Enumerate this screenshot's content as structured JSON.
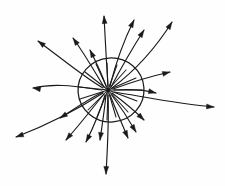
{
  "figure": {
    "background_color": "#fefefe",
    "ink_color": "#1a1a1a",
    "width": 225,
    "height": 186
  },
  "chart_data": {
    "type": "diagram",
    "style": "hand-drawn line art",
    "source_point": {
      "x": 108,
      "y": 90,
      "label": "point source"
    },
    "enclosing_surface": {
      "shape": "ellipse",
      "cx": 111,
      "cy": 90,
      "rx": 33,
      "ry": 32,
      "rotation_deg": -4,
      "stroke": "#1a1a1a"
    },
    "field_line_count": 20,
    "direction": "outward",
    "field_lines": [
      {
        "id": 1,
        "angle_deg": 268,
        "path": "M 108 86 C 106 56 105 34 104 16",
        "tip": [
          104,
          16
        ],
        "tip_angle_deg": 265
      },
      {
        "id": 2,
        "angle_deg": 288,
        "path": "M 110 86 C 116 62 124 40 134 20",
        "tip": [
          134,
          20
        ],
        "tip_angle_deg": 296
      },
      {
        "id": 3,
        "angle_deg": 303,
        "path": "M 111 87 C 120 70 130 52 144 30",
        "tip": [
          144,
          30
        ],
        "tip_angle_deg": 302
      },
      {
        "id": 4,
        "angle_deg": 318,
        "path": "M 112 88 C 128 76 152 54 172 22",
        "tip": [
          172,
          22
        ],
        "tip_angle_deg": 302
      },
      {
        "id": 5,
        "angle_deg": 330,
        "path": "M 113 89 C 132 82 152 76 170 72",
        "tip": [
          170,
          72
        ],
        "tip_angle_deg": 345
      },
      {
        "id": 6,
        "angle_deg": 352,
        "path": "M 114 90 C 132 89 146 90 156 93",
        "tip": [
          156,
          93
        ],
        "tip_angle_deg": 14
      },
      {
        "id": 7,
        "angle_deg": 3,
        "path": "M 114 92 C 140 96 178 104 214 107",
        "tip": [
          214,
          107
        ],
        "tip_angle_deg": 4
      },
      {
        "id": 8,
        "angle_deg": 26,
        "path": "M 112 93 C 124 102 134 110 144 120",
        "tip": [
          144,
          120
        ],
        "tip_angle_deg": 44
      },
      {
        "id": 9,
        "angle_deg": 46,
        "path": "M 111 94 C 120 106 128 118 136 132",
        "tip": [
          136,
          132
        ],
        "tip_angle_deg": 58
      },
      {
        "id": 10,
        "angle_deg": 62,
        "path": "M 110 95 C 116 110 122 124 128 138",
        "tip": [
          128,
          138
        ],
        "tip_angle_deg": 66
      },
      {
        "id": 11,
        "angle_deg": 80,
        "path": "M 108 95 C 109 116 108 140 106 174",
        "tip": [
          106,
          174
        ],
        "tip_angle_deg": 92
      },
      {
        "id": 12,
        "angle_deg": 94,
        "path": "M 106 95 C 104 114 102 126 100 140",
        "tip": [
          100,
          140
        ],
        "tip_angle_deg": 98
      },
      {
        "id": 13,
        "angle_deg": 108,
        "path": "M 105 95 C 100 112 94 126 86 142",
        "tip": [
          86,
          142
        ],
        "tip_angle_deg": 118
      },
      {
        "id": 14,
        "angle_deg": 126,
        "path": "M 104 94 C 94 106 82 122 66 140",
        "tip": [
          66,
          140
        ],
        "tip_angle_deg": 130
      },
      {
        "id": 15,
        "angle_deg": 146,
        "path": "M 103 93 C 86 104 60 120 16 137",
        "tip": [
          16,
          137
        ],
        "tip_angle_deg": 160
      },
      {
        "id": 16,
        "angle_deg": 160,
        "path": "M 103 92 C 90 98 76 108 60 118",
        "tip": [
          60,
          118
        ],
        "tip_angle_deg": 148
      },
      {
        "id": 17,
        "angle_deg": 182,
        "path": "M 102 90 C 84 88 58 82 33 88",
        "tip": [
          33,
          88
        ],
        "tip_angle_deg": 190
      },
      {
        "id": 18,
        "angle_deg": 206,
        "path": "M 103 88 C 88 80 66 62 38 41",
        "tip": [
          38,
          41
        ],
        "tip_angle_deg": 217
      },
      {
        "id": 19,
        "angle_deg": 232,
        "path": "M 104 87 C 96 74 86 56 73 38",
        "tip": [
          73,
          38
        ],
        "tip_angle_deg": 235
      },
      {
        "id": 20,
        "angle_deg": 250,
        "path": "M 106 86 C 102 74 96 62 90 50",
        "tip": [
          90,
          50
        ],
        "tip_angle_deg": 244
      }
    ],
    "inner_rays": [
      "M 108 90 L 107 63",
      "M 108 90 L 117 65",
      "M 108 90 L 126 70",
      "M 108 90 L 136 78",
      "M 108 90 L 142 90",
      "M 108 90 L 137 101",
      "M 108 90 L 128 112",
      "M 108 90 L 116 117",
      "M 108 90 L 107 120",
      "M 108 90 L 97 117",
      "M 108 90 L 88 110",
      "M 108 90 L 80 99",
      "M 108 90 L 79 87",
      "M 108 90 L 85 72",
      "M 108 90 L 96 64"
    ]
  }
}
